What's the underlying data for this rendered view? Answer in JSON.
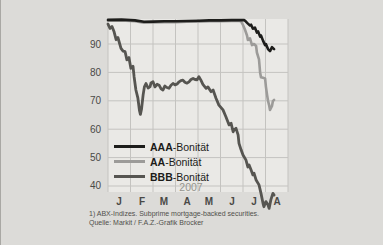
{
  "chart_data": {
    "type": "line",
    "title": "",
    "year_label": "2007",
    "x_tick_labels": [
      "J",
      "F",
      "M",
      "A",
      "M",
      "J",
      "J",
      "A"
    ],
    "y_ticks": [
      90,
      80,
      70,
      60,
      50,
      40
    ],
    "ylim": [
      32,
      99
    ],
    "x_axis_note": "months January-August 2007, 9 vertical gridlines",
    "grid": true,
    "legend_position": "inside lower-left",
    "colors": {
      "page_background": "#dcdbd8",
      "plot_background": "#eae9e6",
      "gridline": "#c4c3c0",
      "axis_text": "#4a4946",
      "muted_text": "#96958f"
    },
    "legend": [
      {
        "bold": "AAA",
        "rest": "-Bonität"
      },
      {
        "bold": "AA",
        "rest": "-Bonität"
      },
      {
        "bold": "BBB",
        "rest": "-Bonität"
      }
    ],
    "series": [
      {
        "name": "AAA-Bonität",
        "color": "#1d1d1b",
        "points": [
          [
            0,
            98.5
          ],
          [
            0.6,
            98.6
          ],
          [
            1.2,
            98.3
          ],
          [
            1.6,
            97.8
          ],
          [
            2,
            97.9
          ],
          [
            2.5,
            98
          ],
          [
            3,
            98
          ],
          [
            3.5,
            98.1
          ],
          [
            4,
            98.2
          ],
          [
            4.5,
            98.3
          ],
          [
            5,
            98.3
          ],
          [
            5.5,
            98.4
          ],
          [
            6.05,
            98.4
          ],
          [
            6.13,
            97.9
          ],
          [
            6.22,
            97.2
          ],
          [
            6.31,
            96.5
          ],
          [
            6.36,
            96.8
          ],
          [
            6.44,
            95.4
          ],
          [
            6.53,
            95.8
          ],
          [
            6.62,
            94
          ],
          [
            6.67,
            94.4
          ],
          [
            6.76,
            92.6
          ],
          [
            6.8,
            93
          ],
          [
            6.89,
            91.2
          ],
          [
            6.98,
            89.6
          ],
          [
            7.02,
            90
          ],
          [
            7.11,
            88.2
          ],
          [
            7.2,
            87.5
          ],
          [
            7.29,
            88.9
          ],
          [
            7.38,
            88.2
          ]
        ]
      },
      {
        "name": "AA-Bonität",
        "color": "#9c9b99",
        "points": [
          [
            0,
            98.2
          ],
          [
            0.6,
            98.3
          ],
          [
            1.2,
            98
          ],
          [
            1.6,
            97.5
          ],
          [
            2,
            97.6
          ],
          [
            2.5,
            97.7
          ],
          [
            3,
            97.7
          ],
          [
            3.5,
            97.8
          ],
          [
            4,
            97.9
          ],
          [
            4.5,
            98
          ],
          [
            5,
            98
          ],
          [
            5.5,
            98.1
          ],
          [
            5.82,
            98.1
          ],
          [
            5.91,
            98
          ],
          [
            6,
            96.7
          ],
          [
            6.09,
            95
          ],
          [
            6.18,
            93
          ],
          [
            6.22,
            91.4
          ],
          [
            6.31,
            92
          ],
          [
            6.4,
            89.6
          ],
          [
            6.49,
            90
          ],
          [
            6.58,
            89.3
          ],
          [
            6.62,
            87
          ],
          [
            6.71,
            84.6
          ],
          [
            6.76,
            80
          ],
          [
            6.8,
            78.3
          ],
          [
            6.89,
            78.1
          ],
          [
            6.98,
            77.9
          ],
          [
            7.02,
            75
          ],
          [
            7.07,
            72
          ],
          [
            7.11,
            70
          ],
          [
            7.16,
            68.5
          ],
          [
            7.2,
            66.8
          ],
          [
            7.29,
            68.2
          ],
          [
            7.33,
            69.9
          ],
          [
            7.38,
            70.3
          ]
        ]
      },
      {
        "name": "BBB-Bonität",
        "color": "#565551",
        "points": [
          [
            0,
            97
          ],
          [
            0.09,
            95.5
          ],
          [
            0.18,
            96.2
          ],
          [
            0.27,
            94.3
          ],
          [
            0.36,
            91.5
          ],
          [
            0.44,
            92.3
          ],
          [
            0.58,
            88.5
          ],
          [
            0.67,
            87.5
          ],
          [
            0.76,
            87.3
          ],
          [
            0.84,
            84.4
          ],
          [
            0.93,
            85.2
          ],
          [
            1.02,
            81.4
          ],
          [
            1.11,
            82.2
          ],
          [
            1.16,
            78.5
          ],
          [
            1.24,
            73.8
          ],
          [
            1.33,
            70.9
          ],
          [
            1.4,
            66.5
          ],
          [
            1.44,
            65.2
          ],
          [
            1.49,
            67
          ],
          [
            1.56,
            72
          ],
          [
            1.62,
            74.9
          ],
          [
            1.69,
            76.1
          ],
          [
            1.78,
            74.5
          ],
          [
            1.87,
            75
          ],
          [
            1.91,
            76.3
          ],
          [
            2,
            76.7
          ],
          [
            2.09,
            74.9
          ],
          [
            2.18,
            75.8
          ],
          [
            2.27,
            75.5
          ],
          [
            2.36,
            74.2
          ],
          [
            2.44,
            73.8
          ],
          [
            2.53,
            75.2
          ],
          [
            2.62,
            74.7
          ],
          [
            2.71,
            74.4
          ],
          [
            2.8,
            75.5
          ],
          [
            2.89,
            76.1
          ],
          [
            2.98,
            75.6
          ],
          [
            3.07,
            75.9
          ],
          [
            3.16,
            76.7
          ],
          [
            3.24,
            77.1
          ],
          [
            3.33,
            77.3
          ],
          [
            3.42,
            76.5
          ],
          [
            3.51,
            76.2
          ],
          [
            3.6,
            76.7
          ],
          [
            3.69,
            77.5
          ],
          [
            3.78,
            77.9
          ],
          [
            3.87,
            77.5
          ],
          [
            3.96,
            77.4
          ],
          [
            4.04,
            78.5
          ],
          [
            4.13,
            77.3
          ],
          [
            4.22,
            75.8
          ],
          [
            4.36,
            74.4
          ],
          [
            4.44,
            74.9
          ],
          [
            4.58,
            73.2
          ],
          [
            4.67,
            73.8
          ],
          [
            4.8,
            70.9
          ],
          [
            4.93,
            68.5
          ],
          [
            5.11,
            66.8
          ],
          [
            5.24,
            64.4
          ],
          [
            5.38,
            61.5
          ],
          [
            5.47,
            62.1
          ],
          [
            5.56,
            59.1
          ],
          [
            5.6,
            59.7
          ],
          [
            5.69,
            60.3
          ],
          [
            5.78,
            58
          ],
          [
            5.82,
            55
          ],
          [
            5.91,
            52.8
          ],
          [
            6,
            50.9
          ],
          [
            6.13,
            49.2
          ],
          [
            6.22,
            46.7
          ],
          [
            6.27,
            47.4
          ],
          [
            6.36,
            45.6
          ],
          [
            6.44,
            43.9
          ],
          [
            6.49,
            44.5
          ],
          [
            6.58,
            42.1
          ],
          [
            6.71,
            40.4
          ],
          [
            6.8,
            37.4
          ],
          [
            6.89,
            33.9
          ],
          [
            6.93,
            32.7
          ],
          [
            7.02,
            34.5
          ],
          [
            7.11,
            33.3
          ],
          [
            7.16,
            32.1
          ],
          [
            7.24,
            35.2
          ],
          [
            7.33,
            37.4
          ],
          [
            7.38,
            36.8
          ]
        ]
      }
    ],
    "footnote": "1) ABX-Indizes. Subprime mortgage-backed securities.",
    "source": "Quelle: Markit / F.A.Z.-Grafik Brocker"
  }
}
